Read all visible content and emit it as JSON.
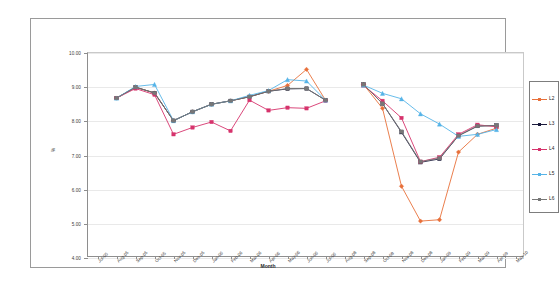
{
  "chart_data": {
    "type": "line",
    "title": "",
    "xlabel": "Month",
    "ylabel": "%",
    "ylim": [
      4.0,
      10.0
    ],
    "ytick_step": 1.0,
    "ytick_labels": [
      "10.00",
      "9.00",
      "8.00",
      "7.00",
      "6.00",
      "5.00",
      "4.00"
    ],
    "grid": true,
    "legend_position": "right",
    "categories": [
      "Jul-05",
      "Aug-05",
      "Sep-05",
      "Oct-05",
      "Nov-05",
      "Dec-05",
      "Jan-06",
      "Feb-06",
      "Mar-06",
      "Apr-06",
      "May-06",
      "Jun-06",
      "Jul-06",
      "Aug-06",
      "Sep-06",
      "Oct-06",
      "Nov-06",
      "Dec-06",
      "Jan-07",
      "Feb-07",
      "Mar-07",
      "Apr-07",
      "May-07"
    ],
    "xtick_labels": [
      "Jul-05",
      "Aug-05",
      "Sep-05",
      "Oct-05",
      "Nov-05",
      "Dec-05",
      "Jan-06",
      "Feb-06",
      "Mar-06",
      "Apr-06",
      "May-06",
      "Jun-06",
      "Jul-06",
      "Aug-08",
      "Sep-08",
      "Oct-08",
      "Nov-08",
      "Dec-08",
      "Jan-09",
      "Feb-09",
      "Mar-09",
      "Apr-09",
      "May-10"
    ],
    "series": [
      {
        "name": "L2",
        "color": "#E8703A",
        "marker": "diamond",
        "values": [
          null,
          8.68,
          9.0,
          8.83,
          8.02,
          8.28,
          8.5,
          8.6,
          8.72,
          8.88,
          9.05,
          9.52,
          8.62,
          null,
          9.08,
          8.38,
          6.1,
          5.08,
          5.12,
          7.1,
          7.62,
          7.8,
          null
        ]
      },
      {
        "name": "L3",
        "color": "#1A1A3C",
        "marker": "square",
        "values": [
          null,
          8.68,
          9.0,
          8.83,
          8.02,
          8.28,
          8.5,
          8.6,
          8.72,
          8.88,
          8.95,
          8.96,
          8.62,
          null,
          9.08,
          8.52,
          7.68,
          6.8,
          6.9,
          7.58,
          7.86,
          7.88,
          null
        ]
      },
      {
        "name": "L4",
        "color": "#D6336C",
        "marker": "square",
        "values": [
          null,
          8.68,
          8.96,
          8.78,
          7.62,
          7.82,
          7.98,
          7.72,
          8.62,
          8.32,
          8.4,
          8.38,
          8.6,
          null,
          9.05,
          8.6,
          8.1,
          6.82,
          6.95,
          7.62,
          7.9,
          7.84,
          null
        ]
      },
      {
        "name": "L5",
        "color": "#56B4E8",
        "marker": "triangle",
        "values": [
          null,
          8.68,
          9.02,
          9.08,
          8.02,
          8.28,
          8.5,
          8.6,
          8.76,
          8.9,
          9.22,
          9.18,
          8.62,
          null,
          9.06,
          8.82,
          8.66,
          8.22,
          7.92,
          7.56,
          7.62,
          7.76,
          null
        ]
      },
      {
        "name": "L6",
        "color": "#777777",
        "marker": "square",
        "values": [
          null,
          8.68,
          9.0,
          8.83,
          8.02,
          8.28,
          8.5,
          8.6,
          8.72,
          8.88,
          8.96,
          8.96,
          8.62,
          null,
          9.08,
          8.52,
          7.7,
          6.82,
          6.92,
          7.58,
          7.86,
          7.88,
          null
        ]
      }
    ],
    "legend": [
      {
        "label": "L2",
        "color": "#E8703A"
      },
      {
        "label": "L3",
        "color": "#1A1A3C"
      },
      {
        "label": "L4",
        "color": "#D6336C"
      },
      {
        "label": "L5",
        "color": "#56B4E8"
      },
      {
        "label": "L6",
        "color": "#777777"
      }
    ]
  }
}
